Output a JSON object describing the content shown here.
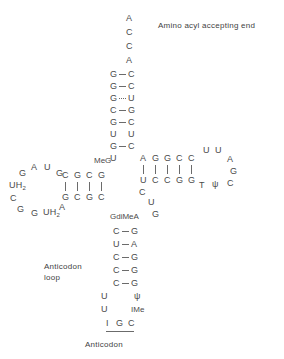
{
  "figure": {
    "title_right": "Amino acyl accepting end",
    "anticodon_loop_label": "Anticodon\nloop",
    "anticodon_label": "Anticodon"
  },
  "acceptor_end": {
    "single_strand": [
      "A",
      "C",
      "C",
      "A"
    ]
  },
  "acceptor_stem": {
    "pairs": [
      {
        "left": "G",
        "right": "C",
        "bond": "solid"
      },
      {
        "left": "G",
        "right": "C",
        "bond": "solid"
      },
      {
        "left": "G",
        "right": "U",
        "bond": "dotted"
      },
      {
        "left": "C",
        "right": "G",
        "bond": "solid"
      },
      {
        "left": "G",
        "right": "C",
        "bond": "solid"
      },
      {
        "left": "U",
        "right": "U",
        "bond": "none"
      },
      {
        "left": "G",
        "right": "C",
        "bond": "solid"
      },
      {
        "left": "U",
        "right": "",
        "bond": "none"
      }
    ]
  },
  "t_psi_c_arm": {
    "top_strand": [
      "A",
      "G",
      "G",
      "C",
      "C"
    ],
    "bottom_strand": [
      "U",
      "C",
      "C",
      "G",
      "G"
    ],
    "loop": [
      "U",
      "U",
      "A",
      "G",
      "C",
      "ψ",
      "T"
    ],
    "loop_left_modified": "T",
    "loop_psi": "ψ"
  },
  "d_arm": {
    "top_strand": [
      "C",
      "G",
      "C",
      "G"
    ],
    "bottom_strand": [
      "G",
      "C",
      "G",
      "C"
    ],
    "modified_label": "MeG",
    "loop": [
      "G",
      "A",
      "U",
      "G",
      "A",
      "UH2",
      "G",
      "G",
      "C",
      "UH2"
    ]
  },
  "variable_loop": {
    "residues": [
      "C",
      "U",
      "G"
    ],
    "modified_label": "GdiMeA"
  },
  "anticodon_arm": {
    "pairs": [
      {
        "left": "C",
        "right": "G"
      },
      {
        "left": "U",
        "right": "A"
      },
      {
        "left": "C",
        "right": "G"
      },
      {
        "left": "C",
        "right": "G"
      },
      {
        "left": "C",
        "right": "G"
      }
    ],
    "loop_left": [
      "U",
      "U"
    ],
    "loop_right": [
      "ψ",
      "IMe"
    ],
    "anticodon_bases": [
      "I",
      "G",
      "C"
    ]
  }
}
